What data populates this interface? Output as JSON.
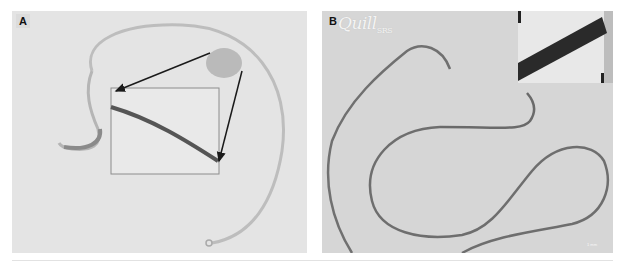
{
  "figure": {
    "panels": [
      {
        "id": "A",
        "label": "A",
        "description": "Looped wire photographed on light background with circled region magnified in an inset box connected by arrows"
      },
      {
        "id": "B",
        "label": "B",
        "watermark": "Quill",
        "watermark_suffix": "SRS",
        "description": "Long coiled barbed suture on grey background with high-magnification inset at top right",
        "scale_bar_text": "1 mm"
      }
    ]
  },
  "colors": {
    "panel_a_bg": "#e4e4e4",
    "panel_b_bg": "#d6d6d6",
    "wire_a": "#b8b8b8",
    "wire_b": "#6e6e6e",
    "arrow": "#1a1a1a",
    "highlight_circle": "#a8a8a8"
  }
}
